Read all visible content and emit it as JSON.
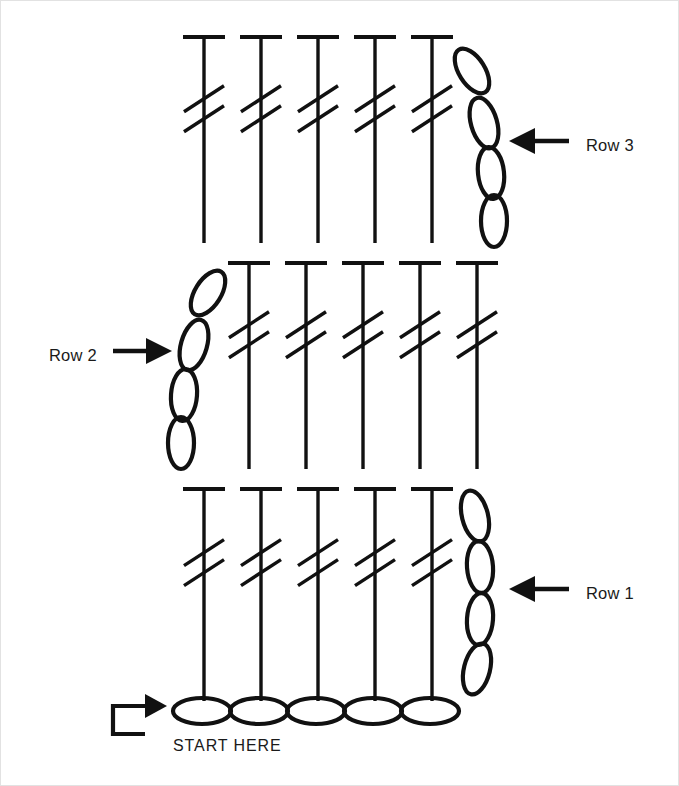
{
  "diagram": {
    "type": "crochet-stitch-diagram",
    "canvas": {
      "width": 679,
      "height": 786,
      "background": "#ffffff",
      "border_color": "#e2e2e2"
    },
    "ink_color": "#111111",
    "labels": {
      "row3": "Row 3",
      "row2": "Row 2",
      "row1": "Row 1",
      "start": "START HERE"
    },
    "legend_symbols": {
      "double_treble": "vertical-bar-with-top-cap-and-two-slashes",
      "chain": "oval",
      "foundation_chain": "horizontal-oval"
    },
    "rows": [
      {
        "name": "Row 3",
        "direction": "right-to-left",
        "arrow": {
          "tip_x": 508,
          "y": 140,
          "tail_x": 568
        },
        "arrow_side": "right",
        "stitch_count": 5,
        "stitch_type": "double treble",
        "turning_chain_count": 4,
        "turning_chain_side": "right",
        "label_x": 585,
        "label_y": 146,
        "stitch_tops_y": 36,
        "stitch_bottoms_y": 242,
        "stitch_x": [
          203,
          260,
          317,
          374,
          431
        ],
        "chain_ovals": [
          {
            "cx": 471,
            "cy": 70,
            "rx": 13,
            "ry": 25,
            "angle": -32
          },
          {
            "cx": 483,
            "cy": 122,
            "rx": 13,
            "ry": 26,
            "angle": -16
          },
          {
            "cx": 490,
            "cy": 172,
            "rx": 13,
            "ry": 26,
            "angle": -6
          },
          {
            "cx": 493,
            "cy": 220,
            "rx": 13,
            "ry": 26,
            "angle": 0
          }
        ]
      },
      {
        "name": "Row 2",
        "direction": "left-to-right",
        "arrow": {
          "tip_x": 171,
          "y": 350,
          "tail_x": 112
        },
        "arrow_side": "left",
        "stitch_count": 5,
        "stitch_type": "double treble",
        "turning_chain_count": 4,
        "turning_chain_side": "left",
        "label_x": 48,
        "label_y": 356,
        "stitch_tops_y": 262,
        "stitch_bottoms_y": 468,
        "stitch_x": [
          248,
          305,
          362,
          419,
          476
        ],
        "chain_ovals": [
          {
            "cx": 207,
            "cy": 292,
            "rx": 13,
            "ry": 25,
            "angle": 32
          },
          {
            "cx": 193,
            "cy": 344,
            "rx": 13,
            "ry": 26,
            "angle": 16
          },
          {
            "cx": 183,
            "cy": 394,
            "rx": 13,
            "ry": 26,
            "angle": 4
          },
          {
            "cx": 180,
            "cy": 442,
            "rx": 13,
            "ry": 26,
            "angle": 0
          }
        ]
      },
      {
        "name": "Row 1",
        "direction": "right-to-left",
        "arrow": {
          "tip_x": 508,
          "y": 588,
          "tail_x": 568
        },
        "arrow_side": "right",
        "stitch_count": 5,
        "stitch_type": "double treble",
        "turning_chain_count": 4,
        "turning_chain_side": "right",
        "label_x": 585,
        "label_y": 594,
        "stitch_tops_y": 488,
        "stitch_bottoms_y": 700,
        "stitch_x": [
          203,
          260,
          317,
          374,
          431
        ],
        "chain_ovals": [
          {
            "cx": 474,
            "cy": 515,
            "rx": 13,
            "ry": 26,
            "angle": -14
          },
          {
            "cx": 479,
            "cy": 566,
            "rx": 13,
            "ry": 26,
            "angle": -4
          },
          {
            "cx": 479,
            "cy": 618,
            "rx": 13,
            "ry": 26,
            "angle": 4
          },
          {
            "cx": 476,
            "cy": 668,
            "rx": 13,
            "ry": 26,
            "angle": 14
          }
        ]
      }
    ],
    "foundation": {
      "name": "foundation chain",
      "chain_count": 5,
      "y": 710,
      "ovals": [
        {
          "cx": 201,
          "cy": 710,
          "rx": 29,
          "ry": 13
        },
        {
          "cx": 258,
          "cy": 710,
          "rx": 29,
          "ry": 13
        },
        {
          "cx": 315,
          "cy": 710,
          "rx": 29,
          "ry": 13
        },
        {
          "cx": 372,
          "cy": 710,
          "rx": 29,
          "ry": 13
        },
        {
          "cx": 429,
          "cy": 710,
          "rx": 29,
          "ry": 13
        }
      ],
      "start_label_x": 172,
      "start_label_y": 746,
      "hook_arrow": {
        "x": 112,
        "y_top": 705,
        "y_bottom": 733,
        "tip_x": 166
      }
    }
  }
}
